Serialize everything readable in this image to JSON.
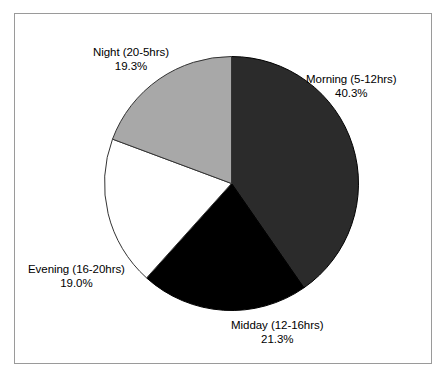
{
  "figure": {
    "background_color": "#ffffff",
    "frame_color": "#9a9a9a",
    "has_frame": true
  },
  "chart_data": {
    "type": "pie",
    "title": "",
    "subtitle": "",
    "xlabel": "",
    "ylabel": "",
    "legend_position": "none",
    "grid": false,
    "start_angle_deg": 90,
    "direction": "clockwise",
    "categories": [
      "Morning (5-12hrs)",
      "Midday (12-16hrs)",
      "Evening (16-20hrs)",
      "Night (20-5hrs)"
    ],
    "values": [
      40.3,
      21.3,
      19.0,
      19.3
    ],
    "value_labels": [
      "40.3%",
      "21.3%",
      "19.0%",
      "19.3%"
    ],
    "colors": [
      "#2b2b2b",
      "#000000",
      "#ffffff",
      "#a8a8a8"
    ],
    "slices": [
      {
        "name": "Morning (5-12hrs)",
        "value": 40.3,
        "value_label": "40.3%",
        "color": "#2b2b2b",
        "edge_color": "#000000"
      },
      {
        "name": "Midday (12-16hrs)",
        "value": 21.3,
        "value_label": "21.3%",
        "color": "#000000",
        "edge_color": "#000000"
      },
      {
        "name": "Evening (16-20hrs)",
        "value": 19.0,
        "value_label": "19.0%",
        "color": "#ffffff",
        "edge_color": "#333333"
      },
      {
        "name": "Night (20-5hrs)",
        "value": 19.3,
        "value_label": "19.3%",
        "color": "#a8a8a8",
        "edge_color": "#333333"
      }
    ],
    "labels": [
      {
        "name": "Morning (5-12hrs)",
        "value_label": "40.3%"
      },
      {
        "name": "Midday (12-16hrs)",
        "value_label": "21.3%"
      },
      {
        "name": "Evening (16-20hrs)",
        "value_label": "19.0%"
      },
      {
        "name": "Night (20-5hrs)",
        "value_label": "19.3%"
      }
    ]
  }
}
